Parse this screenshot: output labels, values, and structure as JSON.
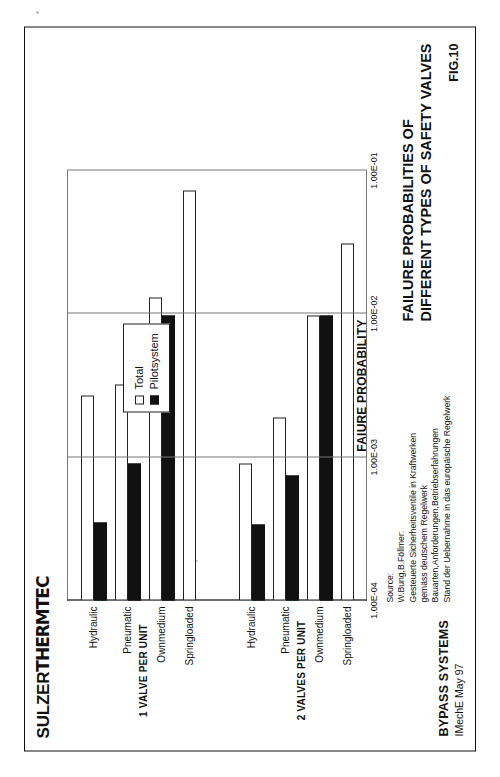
{
  "brand": {
    "part1": "SULZER",
    "part2": "THERMTEC"
  },
  "figure_number": "FIG.10",
  "title": {
    "line1": "FAILURE PROBABILITIES OF",
    "line2": "DIFFERENT TYPES OF SAFETY VALVES"
  },
  "footer": {
    "line1": "BYPASS SYSTEMS",
    "line2": "IMechE  May 97"
  },
  "source": {
    "heading": "Source:",
    "line1": "W.Bung,B.Föllmer:",
    "line2": "Gesteuerte Sicherheitsventile in Kraftwerken",
    "line3": "gemäss deutschem Regelwerk",
    "line4": "Bauarten,Anforderungen,Betriebserfahrungen",
    "line5": "Stand der Uebernahme in das europäische Regelwerk"
  },
  "legend": {
    "items": [
      {
        "label": "Total",
        "style": "total",
        "color": "#ffffff"
      },
      {
        "label": "Pilotsystem",
        "style": "pilot",
        "color": "#111111"
      }
    ]
  },
  "groups": [
    {
      "label": "1 VALVE PER UNIT"
    },
    {
      "label": "2 VALVES PER UNIT"
    }
  ],
  "chart_data": {
    "type": "bar",
    "orientation": "horizontal",
    "title": "FAILURE PROBABILITIES OF DIFFERENT TYPES OF SAFETY VALVES",
    "xlabel": "FAIURE PROBABILITY",
    "ylabel": "",
    "xscale": "log",
    "xlim": [
      0.0001,
      0.1
    ],
    "xticks": [
      "1.00E-04",
      "1.00E-03",
      "1.00E-02",
      "1.00E-01"
    ],
    "xtick_values": [
      0.0001,
      0.001,
      0.01,
      0.1
    ],
    "grid": true,
    "legend_position": "top-left inside plot",
    "categories": [
      "Hydraulic",
      "Pneumatic",
      "Ownmedium",
      "Springloaded",
      "Hydraulic",
      "Pneumatic",
      "Ownmedium",
      "Springloaded"
    ],
    "group_of_category": [
      "1 VALVE PER UNIT",
      "1 VALVE PER UNIT",
      "1 VALVE PER UNIT",
      "1 VALVE PER UNIT",
      "2 VALVES PER UNIT",
      "2 VALVES PER UNIT",
      "2 VALVES PER UNIT",
      "2 VALVES PER UNIT"
    ],
    "series": [
      {
        "name": "Total",
        "values": [
          0.0027,
          0.0032,
          0.013,
          0.072,
          0.0009,
          0.0019,
          0.0098,
          0.031
        ]
      },
      {
        "name": "Pilotsystem",
        "values": [
          0.00035,
          0.0009,
          0.0098,
          null,
          0.00034,
          0.00075,
          0.0098,
          null
        ]
      }
    ]
  },
  "bars": [
    {
      "category": "Hydraulic",
      "group": 1,
      "total": 0.0027,
      "pilot": 0.00035
    },
    {
      "category": "Pneumatic",
      "group": 1,
      "total": 0.0032,
      "pilot": 0.0009
    },
    {
      "category": "Ownmedium",
      "group": 1,
      "total": 0.013,
      "pilot": 0.0098
    },
    {
      "category": "Springloaded",
      "group": 1,
      "total": 0.072,
      "pilot": null
    },
    {
      "category": "Hydraulic",
      "group": 2,
      "total": 0.0009,
      "pilot": 0.00034
    },
    {
      "category": "Pneumatic",
      "group": 2,
      "total": 0.0019,
      "pilot": 0.00075
    },
    {
      "category": "Ownmedium",
      "group": 2,
      "total": 0.0098,
      "pilot": 0.0098
    },
    {
      "category": "Springloaded",
      "group": 2,
      "total": 0.031,
      "pilot": null
    }
  ]
}
